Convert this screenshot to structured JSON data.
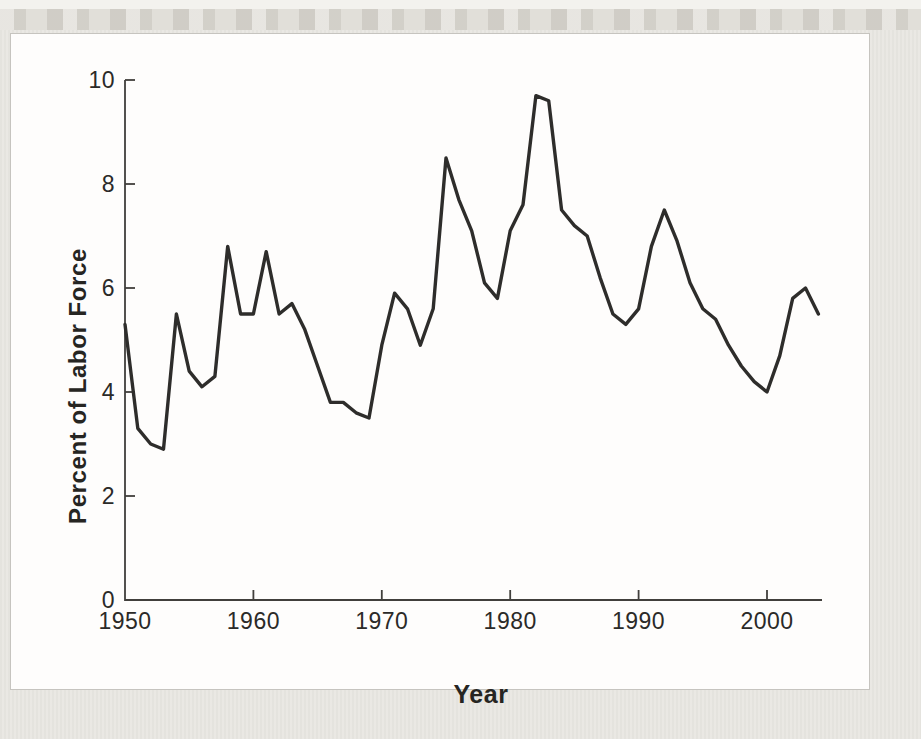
{
  "page": {
    "background_color": "#eae8e3",
    "top_band_color": "#dbd8d1",
    "panel_background": "#fefdfc",
    "panel_border_color": "#c6c4bf"
  },
  "chart_data": {
    "type": "line",
    "title": "",
    "xlabel": "Year",
    "ylabel": "Percent of Labor Force",
    "x": [
      1950,
      1951,
      1952,
      1953,
      1954,
      1955,
      1956,
      1957,
      1958,
      1959,
      1960,
      1961,
      1962,
      1963,
      1964,
      1965,
      1966,
      1967,
      1968,
      1969,
      1970,
      1971,
      1972,
      1973,
      1974,
      1975,
      1976,
      1977,
      1978,
      1979,
      1980,
      1981,
      1982,
      1983,
      1984,
      1985,
      1986,
      1987,
      1988,
      1989,
      1990,
      1991,
      1992,
      1993,
      1994,
      1995,
      1996,
      1997,
      1998,
      1999,
      2000,
      2001,
      2002,
      2003,
      2004
    ],
    "series": [
      {
        "name": "Unemployment rate",
        "values": [
          5.3,
          3.3,
          3.0,
          2.9,
          5.5,
          4.4,
          4.1,
          4.3,
          6.8,
          5.5,
          5.5,
          6.7,
          5.5,
          5.7,
          5.2,
          4.5,
          3.8,
          3.8,
          3.6,
          3.5,
          4.9,
          5.9,
          5.6,
          4.9,
          5.6,
          8.5,
          7.7,
          7.1,
          6.1,
          5.8,
          7.1,
          7.6,
          9.7,
          9.6,
          7.5,
          7.2,
          7.0,
          6.2,
          5.5,
          5.3,
          5.6,
          6.8,
          7.5,
          6.9,
          6.1,
          5.6,
          5.4,
          4.9,
          4.5,
          4.2,
          4.0,
          4.7,
          5.8,
          6.0,
          5.5
        ]
      }
    ],
    "xlim": [
      1950,
      2004.5
    ],
    "ylim": [
      0,
      10
    ],
    "xticks": [
      1950,
      1960,
      1970,
      1980,
      1990,
      2000
    ],
    "yticks": [
      0,
      2,
      4,
      6,
      8,
      10
    ],
    "grid": false,
    "legend_position": "none",
    "line_color": "#2e2d2b",
    "axis_color": "#413f3c",
    "text_color": "#2b2a28"
  }
}
